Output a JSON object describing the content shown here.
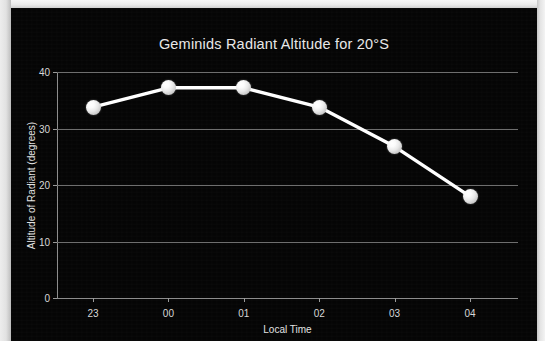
{
  "chart_data": {
    "type": "line",
    "title": "Geminids Radiant Altitude for 20°S",
    "xlabel": "Local Time",
    "ylabel": "Altitude of Radiant (degrees)",
    "categories": [
      "23",
      "00",
      "01",
      "02",
      "03",
      "04"
    ],
    "values": [
      33.8,
      37.2,
      37.2,
      33.8,
      26.8,
      18.0
    ],
    "ylim": [
      0,
      40
    ],
    "yticks": [
      "0",
      "10",
      "20",
      "30",
      "40"
    ],
    "ytick_values": [
      0,
      10,
      20,
      30,
      40
    ],
    "grid": true,
    "legend": false,
    "series": [
      {
        "name": "Radiant Altitude",
        "values": [
          33.8,
          37.2,
          37.2,
          33.8,
          26.8,
          18.0
        ]
      }
    ],
    "colors": {
      "background": "#050505",
      "line": "#ffffff",
      "marker": "#f2f2f2",
      "grid": "#6e6e6e",
      "text": "#e2e2e2"
    }
  }
}
